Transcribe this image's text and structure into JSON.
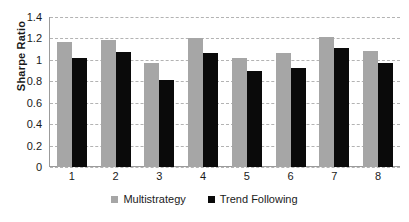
{
  "chart_data": {
    "type": "bar",
    "title": "",
    "xlabel": "",
    "ylabel": "Sharpe Ratio",
    "categories": [
      "1",
      "2",
      "3",
      "4",
      "5",
      "6",
      "7",
      "8"
    ],
    "series": [
      {
        "name": "Multistrategy",
        "color": "#a6a6a6",
        "values": [
          1.17,
          1.19,
          0.97,
          1.2,
          1.02,
          1.06,
          1.21,
          1.08
        ]
      },
      {
        "name": "Trend Following",
        "color": "#0a0a0a",
        "values": [
          1.02,
          1.07,
          0.81,
          1.06,
          0.9,
          0.92,
          1.11,
          0.97
        ]
      }
    ],
    "ylim": [
      0,
      1.4
    ],
    "ytick_step": 0.2,
    "ytick_labels": [
      "1.4",
      "1.2",
      "1",
      "0.8",
      "0.6",
      "0.4",
      "0.2",
      "0"
    ],
    "ytick_values": [
      1.4,
      1.2,
      1.0,
      0.8,
      0.6,
      0.4,
      0.2,
      0
    ],
    "grid": true,
    "grid_style": "dashed",
    "grid_color": "#b3b3b3",
    "legend_position": "bottom",
    "axis_color": "#9b9b9b",
    "background": "#ffffff"
  }
}
